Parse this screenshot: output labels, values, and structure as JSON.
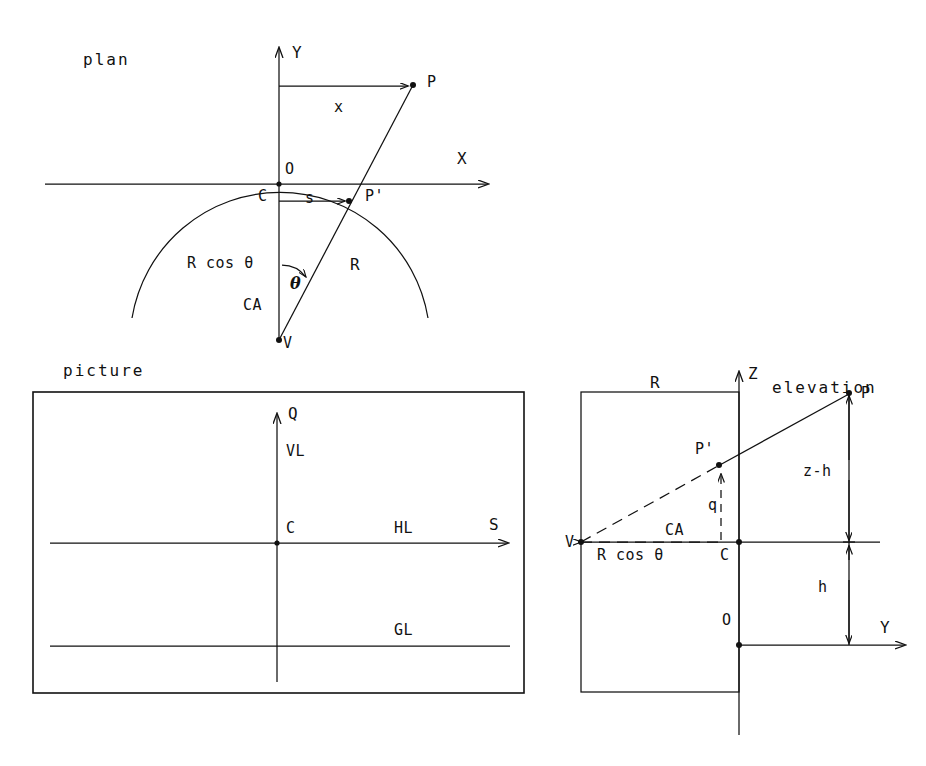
{
  "figure": {
    "stroke_color": "#111111",
    "background": "#ffffff"
  },
  "panels": {
    "plan": {
      "title": "plan",
      "axis_labels": {
        "y": "Y",
        "x": "X"
      },
      "points": {
        "origin": "O",
        "center": "C",
        "p": "P",
        "p_prime": "P'",
        "vertex": "V"
      },
      "measures": {
        "x_offset": "x",
        "s_offset": "s",
        "radius": "R",
        "r_cos_theta": "R cos θ",
        "angle": "θ",
        "central_axis": "CA"
      }
    },
    "picture": {
      "title": "picture",
      "axis_labels": {
        "vertical": "Q",
        "horizontal": "S"
      },
      "lines": {
        "vertical_line": "VL",
        "horizon_line": "HL",
        "ground_line": "GL"
      },
      "points": {
        "center": "C"
      }
    },
    "elevation": {
      "title": "elevation",
      "axis_labels": {
        "vertical": "Z",
        "horizontal": "Y"
      },
      "points": {
        "origin": "O",
        "center": "C",
        "p": "P",
        "p_prime": "P'",
        "vertex": "V"
      },
      "measures": {
        "radius": "R",
        "r_cos_theta": "R cos θ",
        "angle": "θ",
        "central_axis": "CA",
        "q_height": "q",
        "z_minus_h": "z-h",
        "h_height": "h"
      }
    }
  }
}
